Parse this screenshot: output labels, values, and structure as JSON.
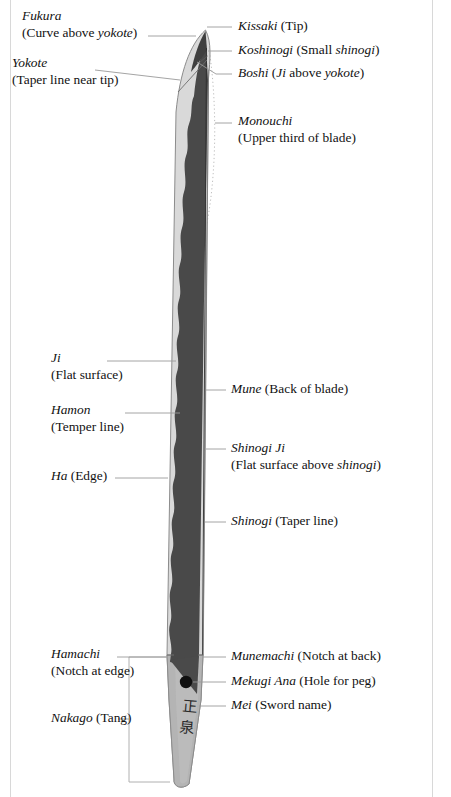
{
  "diagram": {
    "colors": {
      "blade_edge_light": "#d7d7d7",
      "blade_body_dark": "#4a4a4a",
      "tang_gray": "#b3b3b3",
      "outline": "#8a8a8a",
      "leader_line": "#9a9a9a",
      "dotted_arc": "#bdbdbd",
      "peg_hole": "#111111",
      "text": "#111111",
      "page_border": "#d8d8d8"
    }
  },
  "labels_left": [
    {
      "id": "fukura",
      "term": "Fukura",
      "detail_pre": "(Curve above ",
      "detail_italic": "yokote",
      "detail_post": ")",
      "two_line": true
    },
    {
      "id": "yokote",
      "term": "Yokote",
      "detail_pre": "(Taper line near tip)",
      "detail_italic": "",
      "detail_post": "",
      "two_line": true
    },
    {
      "id": "ji",
      "term": "Ji",
      "detail_pre": "(Flat surface)",
      "detail_italic": "",
      "detail_post": "",
      "two_line": true
    },
    {
      "id": "hamon",
      "term": "Hamon",
      "detail_pre": "(Temper line)",
      "detail_italic": "",
      "detail_post": "",
      "two_line": true
    },
    {
      "id": "ha",
      "term": "Ha",
      "detail_pre": " (Edge)",
      "detail_italic": "",
      "detail_post": "",
      "two_line": false
    },
    {
      "id": "hamachi",
      "term": "Hamachi",
      "detail_pre": "(Notch at edge)",
      "detail_italic": "",
      "detail_post": "",
      "two_line": true
    },
    {
      "id": "nakago",
      "term": "Nakago",
      "detail_pre": " (Tang)",
      "detail_italic": "",
      "detail_post": "",
      "two_line": false
    }
  ],
  "labels_right": [
    {
      "id": "kissaki",
      "term": "Kissaki",
      "detail_pre": " (Tip)",
      "detail_italic": "",
      "detail_post": "",
      "two_line": false
    },
    {
      "id": "koshinogi",
      "term": "Koshinogi",
      "detail_pre": " (Small ",
      "detail_italic": "shinogi",
      "detail_post": ")",
      "two_line": false
    },
    {
      "id": "boshi",
      "term": "Boshi",
      "detail_pre": " (",
      "detail_italic": "Ji",
      "detail_mid": " above ",
      "detail_italic2": "yokote",
      "detail_post": ")",
      "two_line": false
    },
    {
      "id": "monouchi",
      "term": "Monouchi",
      "detail_pre": "(Upper third of blade)",
      "detail_italic": "",
      "detail_post": "",
      "two_line": true
    },
    {
      "id": "mune",
      "term": "Mune",
      "detail_pre": " (Back of blade)",
      "detail_italic": "",
      "detail_post": "",
      "two_line": false
    },
    {
      "id": "shinogi-ji",
      "term": "Shinogi Ji",
      "detail_pre": "(Flat surface above ",
      "detail_italic": "shinogi",
      "detail_post": ")",
      "two_line": true
    },
    {
      "id": "shinogi",
      "term": "Shinogi",
      "detail_pre": " (Taper line)",
      "detail_italic": "",
      "detail_post": "",
      "two_line": false
    },
    {
      "id": "munemachi",
      "term": "Munemachi",
      "detail_pre": " (Notch at back)",
      "detail_italic": "",
      "detail_post": "",
      "two_line": false
    },
    {
      "id": "mekugi-ana",
      "term": "Mekugi Ana",
      "detail_pre": " (Hole for peg)",
      "detail_italic": "",
      "detail_post": "",
      "two_line": false
    },
    {
      "id": "mei",
      "term": "Mei",
      "detail_pre": " (Sword name)",
      "detail_italic": "",
      "detail_post": "",
      "two_line": false
    }
  ],
  "signature": {
    "char_top": "正",
    "char_bottom": "泉"
  }
}
